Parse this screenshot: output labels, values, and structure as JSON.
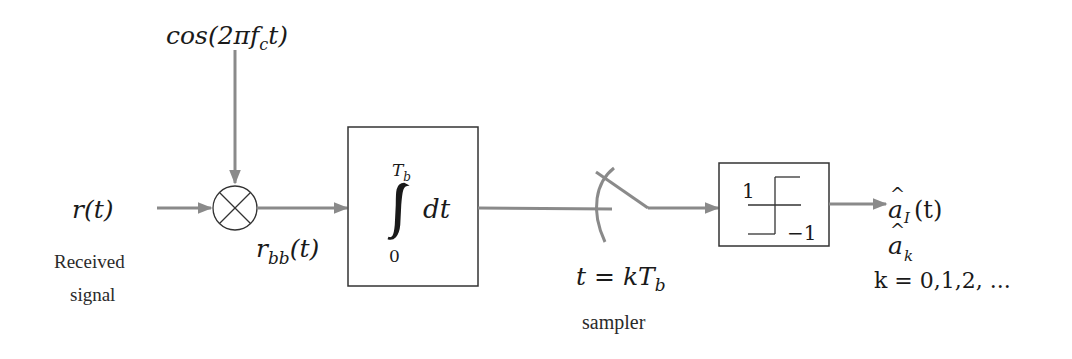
{
  "diagram": {
    "colors": {
      "wire": "#8a8a8a",
      "block_stroke": "#333333",
      "text": "#1a1a1a",
      "background": "#ffffff"
    },
    "input": {
      "symbol": "r(t)",
      "label_line1": "Received",
      "label_line2": "signal"
    },
    "carrier": {
      "expression": "cos(2πf",
      "subscript": "c",
      "suffix": "t)"
    },
    "mixer": {
      "icon": "multiplier-icon",
      "output_symbol": "r",
      "output_subscript": "bb",
      "output_suffix": "(t)"
    },
    "integrator": {
      "upper_limit": "T",
      "upper_limit_sub": "b",
      "lower_limit": "0",
      "integrand": "dt",
      "icon": "integral-sign"
    },
    "sampler": {
      "expression": "t = kT",
      "subscript": "b",
      "label": "sampler",
      "icon": "switch-icon"
    },
    "decision": {
      "upper_level": "1",
      "lower_level": "−1",
      "icon": "signum-icon"
    },
    "outputs": {
      "continuous": {
        "symbol": "a",
        "hat": "^",
        "subscript": "I",
        "suffix": "(t)"
      },
      "discrete": {
        "symbol": "a",
        "hat": "^",
        "subscript": "k"
      },
      "index": "k = 0,1,2, ..."
    }
  }
}
